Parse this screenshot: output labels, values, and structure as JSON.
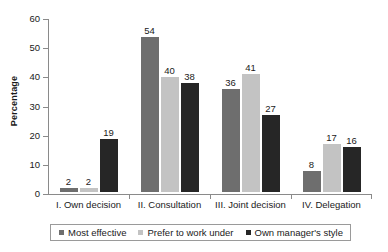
{
  "chart_data": {
    "type": "bar",
    "title": "",
    "xlabel": "",
    "ylabel": "Percentage",
    "ylim": [
      0,
      60
    ],
    "y_ticks": [
      0,
      10,
      20,
      30,
      40,
      50,
      60
    ],
    "grid": false,
    "legend_position": "bottom",
    "categories": [
      "I. Own decision",
      "II. Consultation",
      "III. Joint decision",
      "IV. Delegation"
    ],
    "series": [
      {
        "name": "Most effective",
        "color": "#6e6e6e",
        "values": [
          2,
          54,
          36,
          8
        ]
      },
      {
        "name": "Prefer to work under",
        "color": "#c3c3c3",
        "values": [
          2,
          40,
          41,
          17
        ]
      },
      {
        "name": "Own manager's style",
        "color": "#262626",
        "values": [
          19,
          38,
          27,
          16
        ]
      }
    ]
  },
  "axis": {
    "y_title": "Percentage",
    "tick_labels": [
      "60",
      "50",
      "40",
      "30",
      "20",
      "10",
      "0"
    ]
  },
  "bar_labels": {
    "g0": [
      "2",
      "2",
      "19"
    ],
    "g1": [
      "54",
      "40",
      "38"
    ],
    "g2": [
      "36",
      "41",
      "27"
    ],
    "g3": [
      "8",
      "17",
      "16"
    ]
  },
  "legend": {
    "items": [
      {
        "label": "Most effective"
      },
      {
        "label": "Prefer to work under"
      },
      {
        "label": "Own manager's style"
      }
    ]
  },
  "colors": {
    "series_1": "#6e6e6e",
    "series_2": "#c3c3c3",
    "series_3": "#262626",
    "axis": "#8a8a8a",
    "text": "#1a1a1a",
    "background": "#ffffff"
  }
}
